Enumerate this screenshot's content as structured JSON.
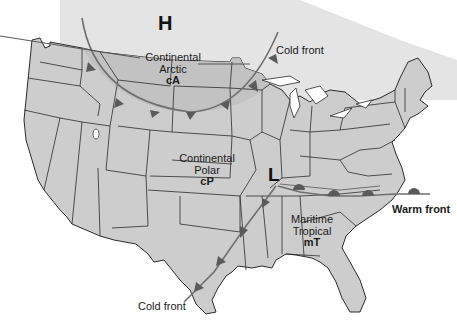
{
  "pressure_centers": {
    "high": {
      "symbol": "H"
    },
    "low": {
      "symbol": "L"
    }
  },
  "air_masses": [
    {
      "name_line1": "Continental",
      "name_line2": "Arctic",
      "code": "cA"
    },
    {
      "name_line1": "Continental",
      "name_line2": "Polar",
      "code": "cP"
    },
    {
      "name_line1": "Maritime",
      "name_line2": "Tropical",
      "code": "mT"
    }
  ],
  "fronts": {
    "cold_front_north": {
      "label": "Cold front"
    },
    "cold_front_south": {
      "label": "Cold front"
    },
    "warm_front": {
      "label": "Warm front"
    }
  },
  "colors": {
    "land": "#cfcfcf",
    "arctic_mass": "#bdbdbd",
    "borders": "#2b2b2b",
    "front_line": "#6f6f6f",
    "front_symbol": "#5a5a5a",
    "background": "#ffffff"
  }
}
